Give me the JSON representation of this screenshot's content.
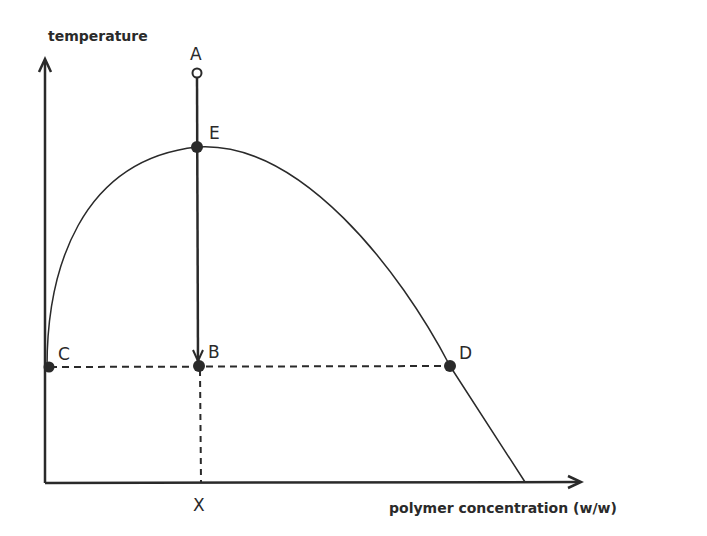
{
  "diagram": {
    "y_axis_label": "temperature",
    "x_axis_label": "polymer concentration (w/w)",
    "x_marker_label": "X",
    "points": {
      "A": "A",
      "E": "E",
      "B": "B",
      "C": "C",
      "D": "D"
    }
  },
  "colors": {
    "ink": "#2a2a2a",
    "background": "#ffffff"
  }
}
